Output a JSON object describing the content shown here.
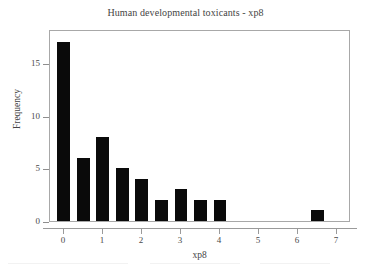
{
  "chart_data": {
    "type": "bar",
    "title": "Human developmental toxicants - xp8",
    "xlabel": "xp8",
    "ylabel": "Frequency",
    "x": [
      0,
      0.5,
      1,
      1.5,
      2,
      2.5,
      3,
      3.5,
      4,
      6.5
    ],
    "values": [
      17,
      6,
      8,
      5,
      4,
      2,
      3,
      2,
      2,
      1
    ],
    "categories": [
      "0",
      "0.5",
      "1",
      "1.5",
      "2",
      "2.5",
      "3",
      "3.5",
      "4",
      "6.5"
    ],
    "bar_width": 0.33,
    "xlim": [
      -0.35,
      7.35
    ],
    "ylim": [
      0,
      18.2
    ],
    "xticks": [
      0,
      1,
      2,
      3,
      4,
      5,
      6,
      7
    ],
    "xtick_labels": [
      "0",
      "1",
      "2",
      "3",
      "4",
      "5",
      "6",
      "7"
    ],
    "yticks": [
      0,
      5,
      10,
      15
    ],
    "ytick_labels": [
      "0",
      "5",
      "10",
      "15"
    ],
    "grid": false,
    "legend": null,
    "bar_color": "#0a0a0a",
    "background_color": "#ffffff",
    "frame_color": "#a8a8a8"
  }
}
